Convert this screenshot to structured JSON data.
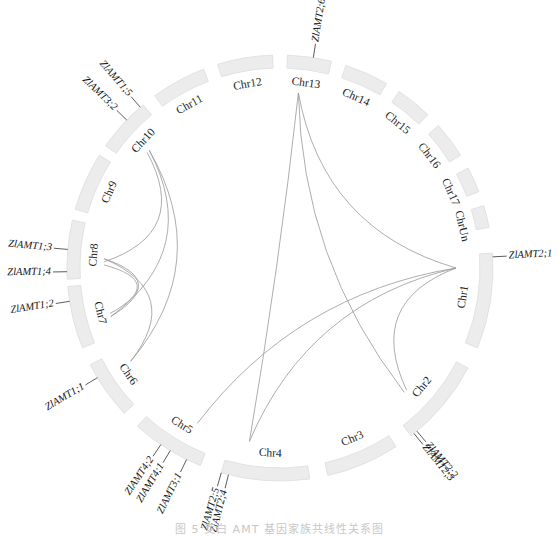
{
  "chart_data": {
    "type": "circos",
    "title": "",
    "center": [
      280,
      268
    ],
    "radius_inner": 200,
    "radius_outer": 213,
    "chromosomes": [
      {
        "name": "Chr1",
        "start": -4,
        "end": 22,
        "label_angle": 9
      },
      {
        "name": "Chr2",
        "start": 28,
        "end": 52,
        "label_angle": 40
      },
      {
        "name": "Chr3",
        "start": 57,
        "end": 77,
        "label_angle": 67
      },
      {
        "name": "Chr4",
        "start": 82,
        "end": 106,
        "label_angle": 93
      },
      {
        "name": "Chr5",
        "start": 112,
        "end": 132,
        "label_angle": 122
      },
      {
        "name": "Chr6",
        "start": 137,
        "end": 153,
        "label_angle": 145
      },
      {
        "name": "Chr7",
        "start": 158,
        "end": 175,
        "label_angle": 166
      },
      {
        "name": "Chr8",
        "start": 177,
        "end": 193,
        "label_angle": 184
      },
      {
        "name": "Chr9",
        "start": 196,
        "end": 212,
        "label_angle": 204
      },
      {
        "name": "Chr10",
        "start": 215,
        "end": 230,
        "label_angle": 223
      },
      {
        "name": "Chr11",
        "start": 234,
        "end": 249,
        "label_angle": 241
      },
      {
        "name": "Chr12",
        "start": 253,
        "end": 268,
        "label_angle": 260
      },
      {
        "name": "Chr13",
        "start": 272,
        "end": 284,
        "label_angle": 278
      },
      {
        "name": "Chr14",
        "start": 288,
        "end": 300,
        "label_angle": 294
      },
      {
        "name": "Chr15",
        "start": 304,
        "end": 314,
        "label_angle": 309
      },
      {
        "name": "Chr16",
        "start": 318,
        "end": 328,
        "label_angle": 323
      },
      {
        "name": "Chr17",
        "start": 332,
        "end": 339,
        "label_angle": 336
      },
      {
        "name": "ChrUn",
        "start": 343,
        "end": 349,
        "label_angle": 347
      }
    ],
    "genes": [
      {
        "name": "ZlAMT2;1",
        "chr": "Chr1",
        "angle": -3,
        "label_r": 250,
        "dir": "out"
      },
      {
        "name": "ZlAMT2;2",
        "chr": "Chr2",
        "angle": 50,
        "label_r": 255,
        "dir": "out"
      },
      {
        "name": "ZlAMT2;3",
        "chr": "Chr2",
        "angle": 51,
        "label_r": 262,
        "dir": "out"
      },
      {
        "name": "ZlAMT2;4",
        "chr": "Chr4",
        "angle": 104,
        "label_r": 262,
        "dir": "out"
      },
      {
        "name": "ZlAMT2;5",
        "chr": "Chr4",
        "angle": 106,
        "label_r": 262,
        "dir": "out"
      },
      {
        "name": "ZlAMT3;1",
        "chr": "Chr5",
        "angle": 116,
        "label_r": 262,
        "dir": "out"
      },
      {
        "name": "ZlAMT4;1",
        "chr": "Chr5",
        "angle": 121,
        "label_r": 262,
        "dir": "out"
      },
      {
        "name": "ZlAMT4;2",
        "chr": "Chr5",
        "angle": 124,
        "label_r": 262,
        "dir": "out"
      },
      {
        "name": "ZlAMT1;1",
        "chr": "Chr6",
        "angle": 149,
        "label_r": 255,
        "dir": "out"
      },
      {
        "name": "ZlAMT1;2",
        "chr": "Chr7",
        "angle": 171,
        "label_r": 250,
        "dir": "out"
      },
      {
        "name": "ZlAMT1;3",
        "chr": "Chr8",
        "angle": 185,
        "label_r": 250,
        "dir": "out"
      },
      {
        "name": "ZlAMT1;4",
        "chr": "Chr8",
        "angle": 179,
        "label_r": 250,
        "dir": "out"
      },
      {
        "name": "ZlAMT3;2",
        "chr": "Chr10",
        "angle": 224,
        "label_r": 250,
        "dir": "out"
      },
      {
        "name": "ZlAMT1;5",
        "chr": "Chr10",
        "angle": 229,
        "label_r": 250,
        "dir": "out"
      },
      {
        "name": "ZlAMT2;6",
        "chr": "Chr13",
        "angle": 279,
        "label_r": 245,
        "dir": "out"
      }
    ],
    "links": [
      {
        "from": "Chr13",
        "a1": 276,
        "to": "Chr1",
        "a2": 0
      },
      {
        "from": "Chr13",
        "a1": 276,
        "to": "Chr2",
        "a2": 45
      },
      {
        "from": "Chr13",
        "a1": 276,
        "to": "Chr4",
        "a2": 100
      },
      {
        "from": "Chr1",
        "a1": 0,
        "to": "Chr4",
        "a2": 100
      },
      {
        "from": "Chr1",
        "a1": 0,
        "to": "Chr2",
        "a2": 44
      },
      {
        "from": "Chr1",
        "a1": 0,
        "to": "Chr5",
        "a2": 118
      },
      {
        "from": "Chr10",
        "a1": 222,
        "to": "Chr7",
        "a2": 164
      },
      {
        "from": "Chr10",
        "a1": 222,
        "to": "Chr6",
        "a2": 148
      },
      {
        "from": "Chr8",
        "a1": 183,
        "to": "Chr7",
        "a2": 164
      },
      {
        "from": "Chr8",
        "a1": 183,
        "to": "Chr6",
        "a2": 148
      },
      {
        "from": "Chr8",
        "a1": 182,
        "to": "Chr10",
        "a2": 221
      },
      {
        "from": "Chr7",
        "a1": 165,
        "to": "Chr8",
        "a2": 181
      }
    ],
    "legend": null
  },
  "caption": "图 5  茭白 AMT 基因家族共线性关系图"
}
